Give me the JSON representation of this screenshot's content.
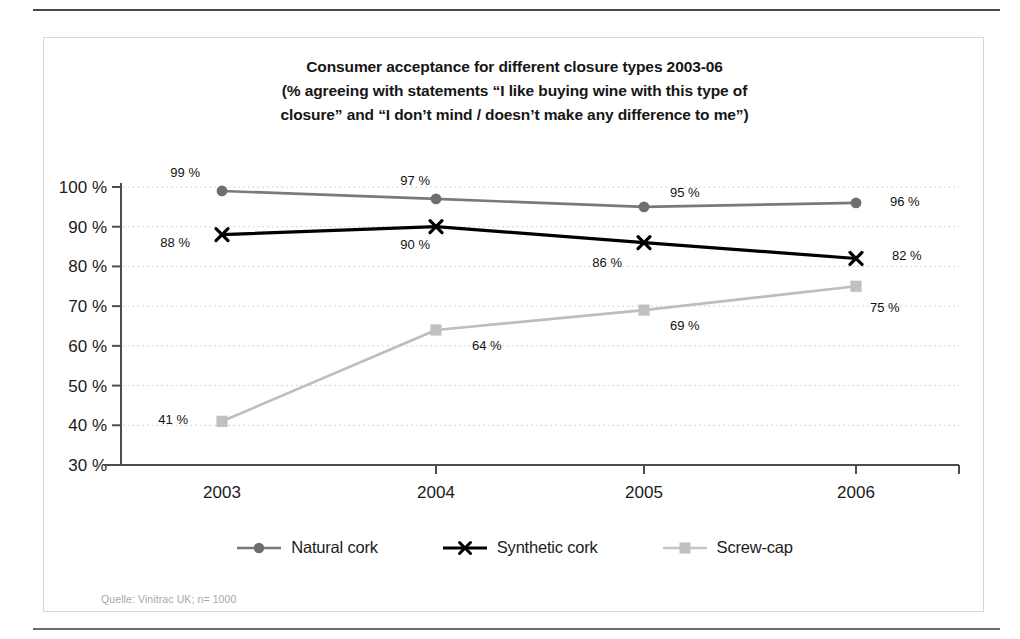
{
  "chart_data": {
    "type": "line",
    "title": "Consumer acceptance for different closure types 2003-06\n(% agreeing with statements “I like buying wine with this type of\nclosure” and “I don’t mind / doesn’t make any difference to me”)",
    "title_lines": [
      "Consumer acceptance for different closure types 2003-06",
      "(% agreeing with statements “I like buying wine with this type of",
      "closure” and “I don’t mind / doesn’t make any difference to me”)"
    ],
    "categories": [
      "2003",
      "2004",
      "2005",
      "2006"
    ],
    "x": [
      2003,
      2004,
      2005,
      2006
    ],
    "series": [
      {
        "name": "Natural cork",
        "values": [
          99,
          97,
          95,
          96
        ],
        "labels": [
          "99 %",
          "97 %",
          "95 %",
          "96 %"
        ],
        "color": "#7a7a7a",
        "marker": "circle"
      },
      {
        "name": "Synthetic cork",
        "values": [
          88,
          90,
          86,
          82
        ],
        "labels": [
          "88 %",
          "90 %",
          "86 %",
          "82 %"
        ],
        "color": "#000000",
        "marker": "x"
      },
      {
        "name": "Screw-cap",
        "values": [
          41,
          64,
          69,
          75
        ],
        "labels": [
          "41 %",
          "64 %",
          "69 %",
          "75 %"
        ],
        "color": "#bdbdbd",
        "marker": "square"
      }
    ],
    "xlabel": "",
    "ylabel": "",
    "ylim": [
      30,
      100
    ],
    "yticks": [
      30,
      40,
      50,
      60,
      70,
      80,
      90,
      100
    ],
    "ytick_labels": [
      "30 %",
      "40 %",
      "50 %",
      "60 %",
      "70 %",
      "80 %",
      "90 %",
      "100 %"
    ],
    "grid": true,
    "grid_style": "dotted",
    "legend_position": "bottom",
    "annotations": [
      "Quelle: Vinitrac UK; n= 1000"
    ]
  },
  "legend": {
    "items": [
      {
        "label": "Natural cork"
      },
      {
        "label": "Synthetic cork"
      },
      {
        "label": "Screw-cap"
      }
    ]
  },
  "source": {
    "text": "Quelle: Vinitrac UK; n= 1000"
  }
}
